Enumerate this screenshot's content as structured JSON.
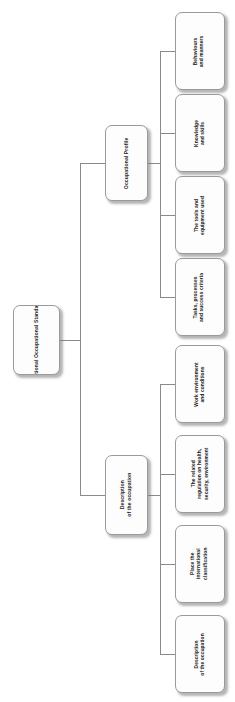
{
  "diagram": {
    "type": "organizational-tree",
    "orientation": "horizontal-left-to-right",
    "text_rotation_degrees": -90,
    "root": {
      "id": "national-occupational-standard",
      "label": "National Occupational Standard"
    },
    "branches": [
      {
        "id": "occupational-profile",
        "label": "Occupational Profile",
        "children": [
          {
            "id": "behaviours-and-manners",
            "label": "Behaviours\nand manners"
          },
          {
            "id": "knowledge-and-skills",
            "label": "Knowledge\nand skills"
          },
          {
            "id": "tools-and-equipment-used",
            "label": "The tools and\nequipment used"
          },
          {
            "id": "tasks-processes-success-criteria",
            "label": "Tasks, processes\nand success criteria"
          }
        ]
      },
      {
        "id": "description-of-the-occupation",
        "label": "Description\nof the occupation",
        "children": [
          {
            "id": "work-environment-and-conditions",
            "label": "Work environment\nand conditions"
          },
          {
            "id": "related-regulation-health-security-environment",
            "label": "The related\nregulation on health,\nsecurity, environment"
          },
          {
            "id": "place-the-international-classification",
            "label": "Place the\ninternational\nclassification"
          },
          {
            "id": "description-of-the-occupation-leaf",
            "label": "Description\nof the occupation"
          }
        ]
      }
    ],
    "style": {
      "box_fill": "#fdfdfd",
      "box_border": "#9a9a9a",
      "connector_color": "#8a8a8a",
      "text_color": "#1d1d1d",
      "background": "#ffffff"
    }
  }
}
